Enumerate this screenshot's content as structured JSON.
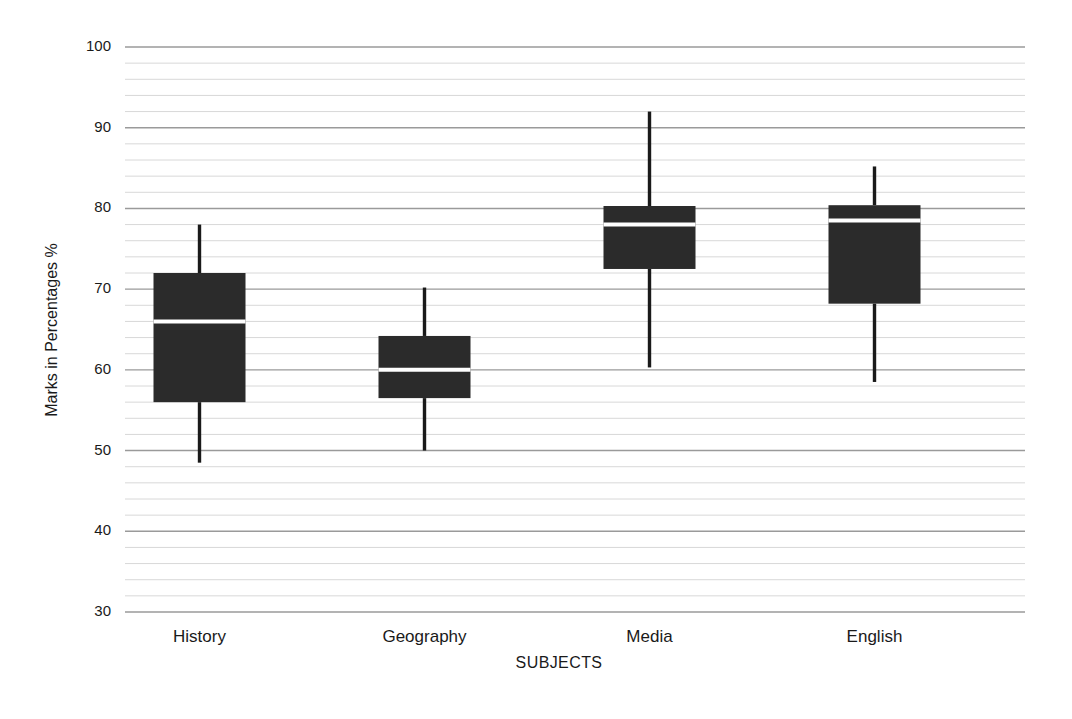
{
  "chart_data": {
    "type": "box",
    "title": "",
    "xlabel": "SUBJECTS",
    "ylabel": "Marks in Percentages %",
    "categories": [
      "History",
      "Geography",
      "Media",
      "English"
    ],
    "ylim": [
      30,
      100
    ],
    "y_major_ticks": [
      30,
      40,
      50,
      60,
      70,
      80,
      90,
      100
    ],
    "y_tick_labels": [
      "30",
      "40",
      "50",
      "60",
      "70",
      "80",
      "90",
      "100"
    ],
    "y_major_step": 10,
    "y_minor_step": 2,
    "grid": "horizontal-major-and-minor",
    "legend": "none",
    "box_color": "#2b2b2b",
    "median_color": "#ffffff",
    "whisker_color": "#1a1a1a",
    "major_gridline_color": "#9a9a9a",
    "minor_gridline_color": "#d8d8d8",
    "boxes": [
      {
        "label": "History",
        "whisker_low": 48.5,
        "q1": 56,
        "median": 66,
        "q3": 72,
        "whisker_high": 78
      },
      {
        "label": "Geography",
        "whisker_low": 50,
        "q1": 56.5,
        "median": 60,
        "q3": 64.2,
        "whisker_high": 70.2
      },
      {
        "label": "Media",
        "whisker_low": 60.3,
        "q1": 72.5,
        "median": 78,
        "q3": 80.3,
        "whisker_high": 92
      },
      {
        "label": "English",
        "whisker_low": 58.5,
        "q1": 68.2,
        "median": 78.5,
        "q3": 80.4,
        "whisker_high": 85.2
      }
    ]
  }
}
